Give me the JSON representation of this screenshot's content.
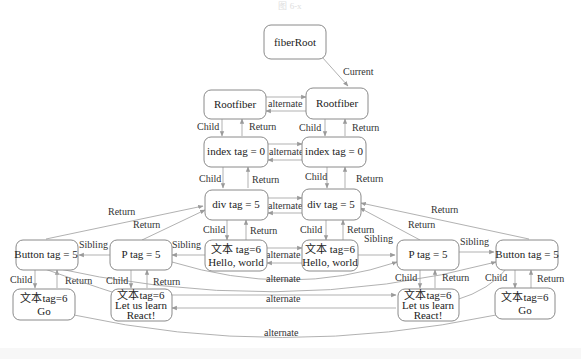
{
  "caption": "图 6-x",
  "nodes": {
    "fiberRoot": {
      "label": "fiberRoot"
    },
    "rootfiber_left": {
      "label": "Rootfiber"
    },
    "rootfiber_right": {
      "label": "Rootfiber"
    },
    "index_left": {
      "label": "index tag = 0"
    },
    "index_right": {
      "label": "index tag = 0"
    },
    "div_left": {
      "label": "div tag = 5"
    },
    "div_right": {
      "label": "div tag = 5"
    },
    "button_left": {
      "label": "Button tag = 5"
    },
    "p_left": {
      "label": "P tag = 5"
    },
    "text_hello_left": {
      "line1": "文本 tag=6",
      "line2": "Hello, world"
    },
    "text_hello_right": {
      "line1": "文本 tag=6",
      "line2": "Hello, world"
    },
    "p_right": {
      "label": "P tag = 5"
    },
    "button_right": {
      "label": "Button tag = 5"
    },
    "text_go_left": {
      "line1": "文本tag=6",
      "line2": "Go"
    },
    "text_react_left": {
      "line1": "文本tag=6",
      "line2": "Let us learn",
      "line3": "React!"
    },
    "text_react_right": {
      "line1": "文本tag=6",
      "line2": "Let us learn",
      "line3": "React!"
    },
    "text_go_right": {
      "line1": "文本tag=6",
      "line2": "Go"
    }
  },
  "edge_labels": {
    "current": "Current",
    "alternate": "alternate",
    "child": "Child",
    "return": "Return",
    "sibling": "Sibling"
  }
}
